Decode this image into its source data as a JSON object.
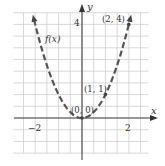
{
  "chart_data": {
    "type": "line",
    "title": "",
    "function_label": "f(x)",
    "xlabel": "x",
    "ylabel": "y",
    "x_ticks_labeled": [
      {
        "value": -2,
        "label": "−2"
      },
      {
        "value": 2,
        "label": "2"
      }
    ],
    "y_ticks_labeled": [
      {
        "value": 4,
        "label": "4"
      }
    ],
    "xlim": [
      -2.5,
      2.5
    ],
    "ylim": [
      -1.5,
      4.5
    ],
    "grid": true,
    "grid_step": 0.5,
    "line_style": "dashed",
    "arrows_on_ends": true,
    "series": [
      {
        "name": "f(x)",
        "equation": "y = x^2",
        "x": [
          -2.1,
          -1.5,
          -1,
          -0.5,
          0,
          0.5,
          1,
          1.5,
          2.1
        ],
        "values": [
          4.41,
          2.25,
          1,
          0.25,
          0,
          0.25,
          1,
          2.25,
          4.41
        ]
      }
    ],
    "annotations": [
      {
        "label": "(0, 0)",
        "x": 0,
        "y": 0
      },
      {
        "label": "(1, 1)",
        "x": 1,
        "y": 1
      },
      {
        "label": "(2, 4)",
        "x": 2,
        "y": 4
      }
    ]
  },
  "colors": {
    "grid": "#cfcfcf",
    "axis": "#444444",
    "curve": "#555555",
    "text": "#333333"
  }
}
